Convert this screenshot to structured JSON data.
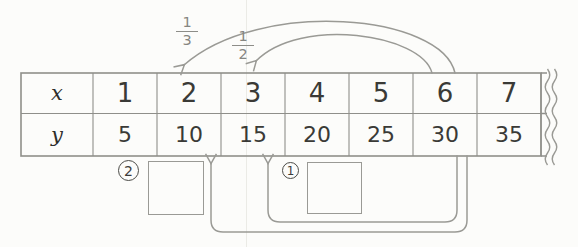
{
  "table": {
    "rows": [
      {
        "header": "x",
        "values": [
          "1",
          "2",
          "3",
          "4",
          "5",
          "6",
          "7"
        ]
      },
      {
        "header": "y",
        "values": [
          "5",
          "10",
          "15",
          "20",
          "25",
          "30",
          "35"
        ]
      }
    ]
  },
  "top_arrows": [
    {
      "fraction": {
        "numerator": "1",
        "denominator": "3"
      },
      "from_column_x": "6",
      "to_column_x": "2"
    },
    {
      "fraction": {
        "numerator": "1",
        "denominator": "2"
      },
      "from_column_x": "6",
      "to_column_x": "3"
    }
  ],
  "bottom_arrows": [
    {
      "label": "2",
      "from_column_y": "30",
      "to_column_y": "10",
      "answer_box_value": ""
    },
    {
      "label": "1",
      "from_column_y": "30",
      "to_column_y": "15",
      "answer_box_value": ""
    }
  ],
  "colors": {
    "line": "#9a9a95",
    "table_line": "#8f8f8a",
    "text": "#3a3a36",
    "fraction": "#868681",
    "background": "#fcfcfa"
  }
}
